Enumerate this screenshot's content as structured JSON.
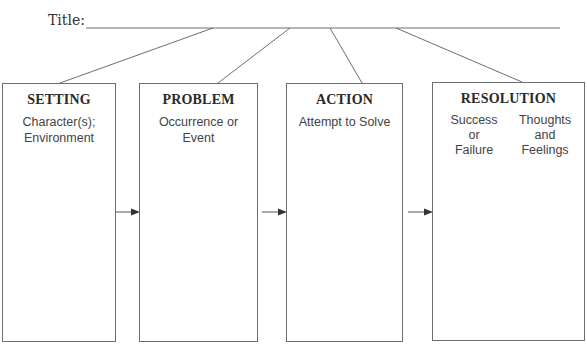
{
  "title": {
    "label": "Title:",
    "value": ""
  },
  "boxes": [
    {
      "heading": "SETTING",
      "sub": [
        "Character(s);",
        "Environment"
      ]
    },
    {
      "heading": "PROBLEM",
      "sub": [
        "Occurrence or",
        "Event"
      ]
    },
    {
      "heading": "ACTION",
      "sub": [
        "Attempt to Solve"
      ]
    },
    {
      "heading": "RESOLUTION",
      "columns": [
        {
          "lines": [
            "Success",
            "or",
            "Failure"
          ]
        },
        {
          "lines": [
            "Thoughts",
            "and",
            "Feelings"
          ]
        }
      ]
    }
  ],
  "colors": {
    "line": "#6e6e6e",
    "text": "#333333"
  }
}
